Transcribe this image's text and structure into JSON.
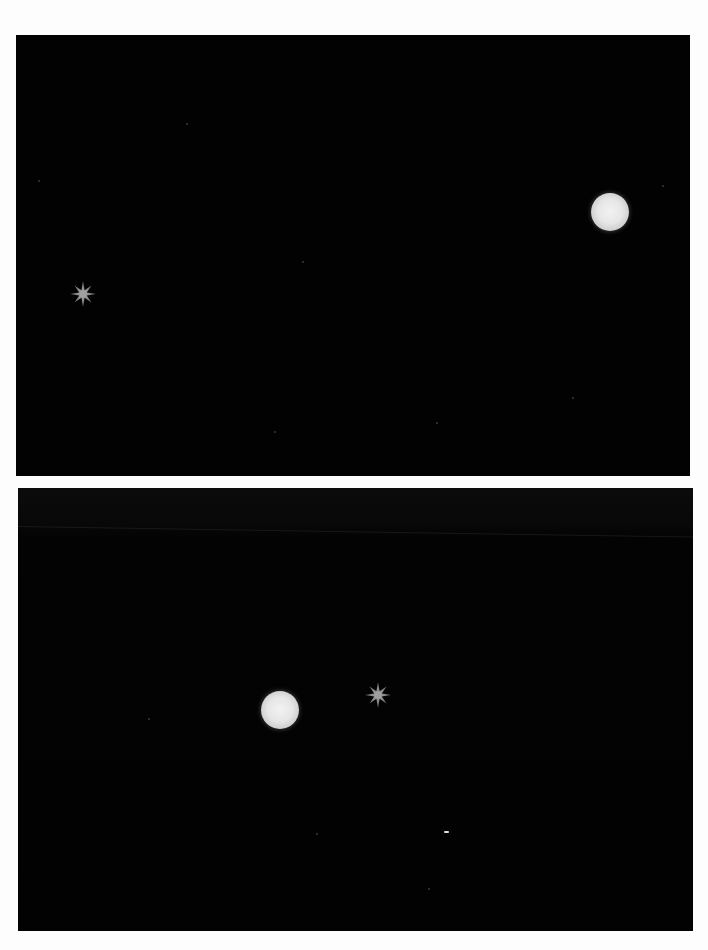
{
  "image": {
    "description": "Two astrophotography frames showing a bright planet and a star",
    "background_color": "#fdfdfd",
    "sky_color": "#020202"
  },
  "panels": [
    {
      "id": "top",
      "objects": [
        {
          "type": "planet",
          "x": 594,
          "y": 177,
          "diameter": 38,
          "color": "#e6e6e6"
        },
        {
          "type": "star",
          "x": 69,
          "y": 245,
          "size": 28,
          "color": "#8c8c8c"
        }
      ]
    },
    {
      "id": "bottom",
      "objects": [
        {
          "type": "planet",
          "x": 243,
          "y": 203,
          "diameter": 38,
          "color": "#e6e6e6"
        },
        {
          "type": "star",
          "x": 346,
          "y": 193,
          "size": 28,
          "color": "#8c8c8c"
        },
        {
          "type": "dash",
          "x": 426,
          "y": 343,
          "color": "#e0e0e0"
        }
      ]
    }
  ]
}
